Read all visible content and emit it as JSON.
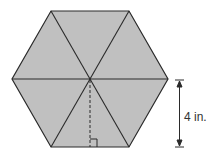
{
  "diagram": {
    "shape": "regular hexagon divided into 6 equilateral triangles",
    "fill_color": "#c0c0c0",
    "stroke_color": "#2a2a2a",
    "height_label": "4 in.",
    "annotations": [
      "dashed apothem from center to bottom side",
      "right-angle mark",
      "double-headed dimension arrow"
    ]
  }
}
